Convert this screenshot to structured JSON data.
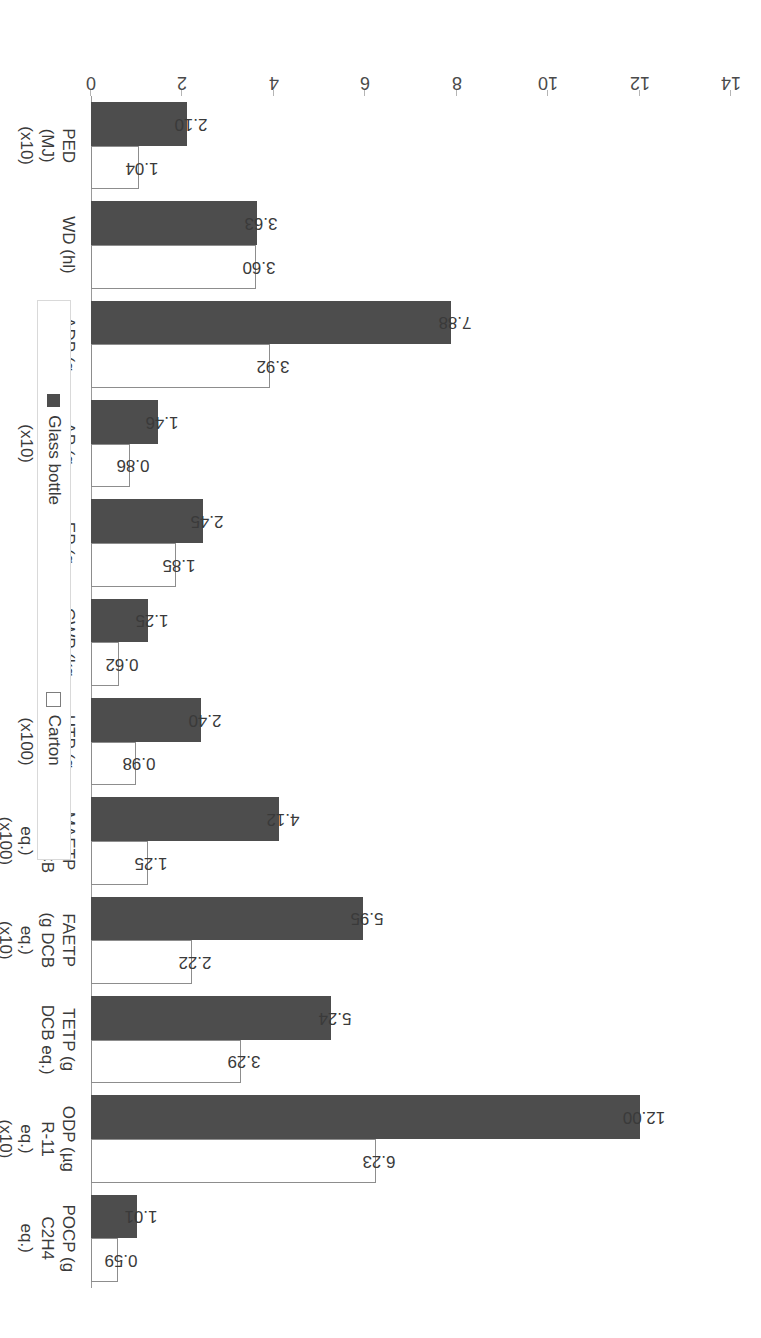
{
  "legend": {
    "position": "top-center",
    "items": [
      {
        "label": "Glass bottle",
        "color": "#4d4d4d",
        "style": "filled"
      },
      {
        "label": "Carton",
        "color": "#ffffff",
        "style": "outlined"
      }
    ]
  },
  "axis": {
    "value_ticks": [
      "0",
      "2",
      "4",
      "6",
      "8",
      "10",
      "12",
      "14"
    ],
    "min": 0,
    "max": 14
  },
  "chart_data": {
    "type": "bar",
    "orientation": "vertical-rotated",
    "title": "",
    "xlabel": "",
    "ylabel": "",
    "ylim": [
      0,
      14
    ],
    "grid": false,
    "categories": [
      "PED\n(MJ)\n(x10)",
      "WD (hl)",
      "ADP (g\nSb eq.)",
      "AP (g\nSO2 eq.)\n(x10)",
      "EP (g\nPO4 eq.)",
      "GWP (kg\nCO2 eq.)",
      "HTP (g\nDCB eq)\n(x100)",
      "MAETP\n(kg DCB\neq.)\n(x100)",
      "FAETP\n(g DCB\neq.)\n(x10)",
      "TETP (g\nDCB eq.)",
      "ODP (µg\nR-11\neq.)\n(x10)",
      "POCP (g\nC2H4\neq.)"
    ],
    "series": [
      {
        "name": "Glass bottle",
        "color": "#4d4d4d",
        "values": [
          2.1,
          3.63,
          7.88,
          1.46,
          2.45,
          1.25,
          2.4,
          4.12,
          5.95,
          5.24,
          12.0,
          1.01
        ],
        "labels": [
          "2.10",
          "3.63",
          "7.88",
          "1.46",
          "2.45",
          "1.25",
          "2.40",
          "4.12",
          "5.95",
          "5.24",
          "12.00",
          "1.01"
        ]
      },
      {
        "name": "Carton",
        "color": "#ffffff",
        "values": [
          1.04,
          3.6,
          3.92,
          0.86,
          1.85,
          0.62,
          0.98,
          1.25,
          2.22,
          3.29,
          6.23,
          0.59
        ],
        "labels": [
          "1.04",
          "3.60",
          "3.92",
          "0.86",
          "1.85",
          "0.62",
          "0.98",
          "1.25",
          "2.22",
          "3.29",
          "6.23",
          "0.59"
        ]
      }
    ]
  }
}
